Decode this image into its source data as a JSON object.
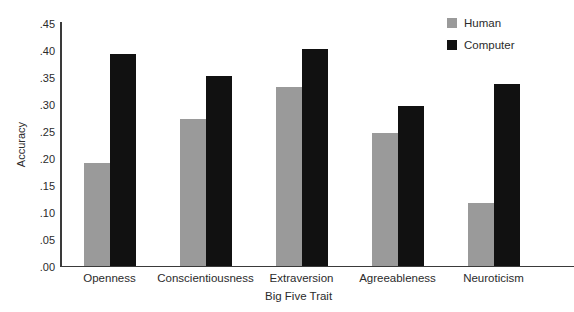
{
  "chart_data": {
    "type": "bar",
    "title": "",
    "subtitle": "",
    "xlabel": "Big Five Trait",
    "ylabel": "Accuracy",
    "categories": [
      "Openness",
      "Conscientiousness",
      "Extraversion",
      "Agreeableness",
      "Neuroticism"
    ],
    "series": [
      {
        "name": "Human",
        "color": "#9a9a9a",
        "values": [
          0.19,
          0.27,
          0.33,
          0.245,
          0.115
        ]
      },
      {
        "name": "Computer",
        "color": "#111111",
        "values": [
          0.39,
          0.35,
          0.4,
          0.295,
          0.335
        ]
      }
    ],
    "ylim": [
      0.0,
      0.45
    ],
    "ytick_labels": [
      ".45",
      ".40",
      ".35",
      ".30",
      ".25",
      ".20",
      ".15",
      ".10",
      ".05",
      ".00"
    ],
    "ytick_values": [
      0.45,
      0.4,
      0.35,
      0.3,
      0.25,
      0.2,
      0.15,
      0.1,
      0.05,
      0.0
    ],
    "grid": false,
    "legend_position": "top-right"
  },
  "legend": {
    "items": [
      {
        "label": "Human",
        "color": "#9a9a9a"
      },
      {
        "label": "Computer",
        "color": "#111111"
      }
    ]
  }
}
